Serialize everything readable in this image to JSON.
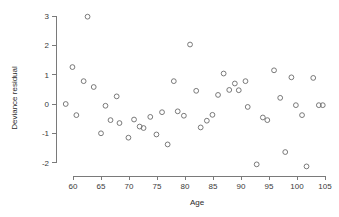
{
  "chart_data": {
    "type": "scatter",
    "title": "",
    "xlabel": "Age",
    "ylabel": "Deviance residual",
    "xlim": [
      57.5,
      105.5
    ],
    "ylim": [
      -2.45,
      3.2
    ],
    "xticks": [
      60,
      65,
      70,
      75,
      80,
      85,
      90,
      95,
      100,
      105
    ],
    "yticks": [
      3,
      2,
      1,
      0,
      -1,
      -2
    ],
    "xtick_labels": [
      "60",
      "65",
      "70",
      "75",
      "80",
      "85",
      "90",
      "95",
      "100",
      "105"
    ],
    "ytick_labels": [
      "3",
      "2",
      "1",
      "0",
      "-1",
      "-2"
    ],
    "grid": false,
    "legend": null,
    "marker": "open-circle",
    "marker_color": "#6b6b6b",
    "points": [
      {
        "x": 58.7,
        "y": 0.0
      },
      {
        "x": 59.9,
        "y": 1.26
      },
      {
        "x": 60.6,
        "y": -0.38
      },
      {
        "x": 61.9,
        "y": 0.78
      },
      {
        "x": 62.6,
        "y": 2.98
      },
      {
        "x": 63.7,
        "y": 0.58
      },
      {
        "x": 65.0,
        "y": -1.0
      },
      {
        "x": 65.8,
        "y": -0.06
      },
      {
        "x": 66.7,
        "y": -0.55
      },
      {
        "x": 67.8,
        "y": 0.26
      },
      {
        "x": 68.3,
        "y": -0.65
      },
      {
        "x": 69.9,
        "y": -1.15
      },
      {
        "x": 70.9,
        "y": -0.53
      },
      {
        "x": 71.9,
        "y": -0.77
      },
      {
        "x": 72.6,
        "y": -0.82
      },
      {
        "x": 73.8,
        "y": -0.44
      },
      {
        "x": 74.9,
        "y": -1.04
      },
      {
        "x": 75.9,
        "y": -0.28
      },
      {
        "x": 76.9,
        "y": -1.38
      },
      {
        "x": 78.0,
        "y": 0.78
      },
      {
        "x": 78.7,
        "y": -0.25
      },
      {
        "x": 79.8,
        "y": -0.4
      },
      {
        "x": 80.9,
        "y": 2.03
      },
      {
        "x": 82.0,
        "y": 0.45
      },
      {
        "x": 82.8,
        "y": -0.8
      },
      {
        "x": 83.9,
        "y": -0.57
      },
      {
        "x": 84.9,
        "y": -0.37
      },
      {
        "x": 85.9,
        "y": 0.31
      },
      {
        "x": 86.9,
        "y": 1.04
      },
      {
        "x": 87.9,
        "y": 0.48
      },
      {
        "x": 88.9,
        "y": 0.7
      },
      {
        "x": 89.6,
        "y": 0.47
      },
      {
        "x": 90.8,
        "y": 0.78
      },
      {
        "x": 91.2,
        "y": -0.1
      },
      {
        "x": 92.8,
        "y": -2.06
      },
      {
        "x": 93.9,
        "y": -0.46
      },
      {
        "x": 94.7,
        "y": -0.55
      },
      {
        "x": 95.9,
        "y": 1.15
      },
      {
        "x": 97.0,
        "y": 0.21
      },
      {
        "x": 97.9,
        "y": -1.64
      },
      {
        "x": 99.0,
        "y": 0.91
      },
      {
        "x": 99.8,
        "y": -0.04
      },
      {
        "x": 100.9,
        "y": -0.38
      },
      {
        "x": 101.7,
        "y": -2.13
      },
      {
        "x": 102.9,
        "y": 0.89
      },
      {
        "x": 103.9,
        "y": -0.04
      },
      {
        "x": 104.6,
        "y": -0.04
      }
    ]
  }
}
